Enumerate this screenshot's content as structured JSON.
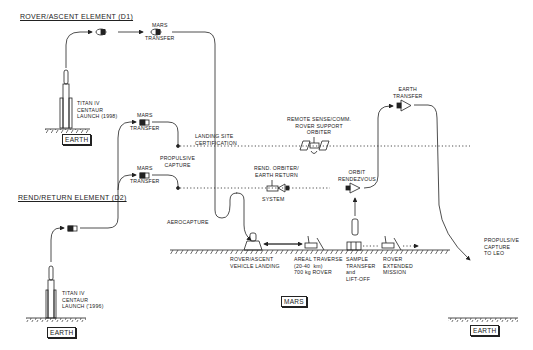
{
  "elements": {
    "d1_title": "ROVER/ASCENT ELEMENT (D1)",
    "d2_title": "REND/RETURN ELEMENT (D2)"
  },
  "labels": {
    "d1_launch": "TITAN IV\nCENTAUR\nLAUNCH (1998)",
    "d2_launch": "TITAN IV\nCENTAUR\nLAUNCH ('1996)",
    "mars_transfer_top": "MARS\n\nTRANSFER",
    "mars_transfer_mid": "MARS\n\nTRANSFER",
    "mars_transfer_low": "MARS\n\nTRANSFER",
    "propulsive_capture": "PROPULSIVE\nCAPTURE",
    "landing_site": "LANDING SITE\nCERTIFICATION",
    "remote_sense": "REMOTE SENSE/COMM.\nROVER SUPPORT\nORBITER",
    "rend_orbiter": "REND. ORBITER/\nEARTH RETURN",
    "system": "SYSTEM",
    "orbit_rendezvous": "ORBIT\nRENDEZVOUS",
    "earth_transfer": "EARTH\nTRANSFER",
    "aerocapture": "AEROCAPTURE",
    "rover_landing": "ROVER/ASCENT\nVEHICLE LANDING",
    "areal_traverse": "AREAL TRAVERSE\n(20-40  km)\n700 kg ROVER",
    "sample_transfer": "SAMPLE\nTRANSFER\nand\nLIFT-OFF",
    "rover_extended": "ROVER\nEXTENDED\nMISSION",
    "propulsive_leo": "PROPULSIVE\nCAPTURE\nTO LEO"
  },
  "bodies": {
    "earth_d1": "EARTH",
    "earth_d2": "EARTH",
    "mars": "MARS",
    "earth_return": "EARTH"
  }
}
